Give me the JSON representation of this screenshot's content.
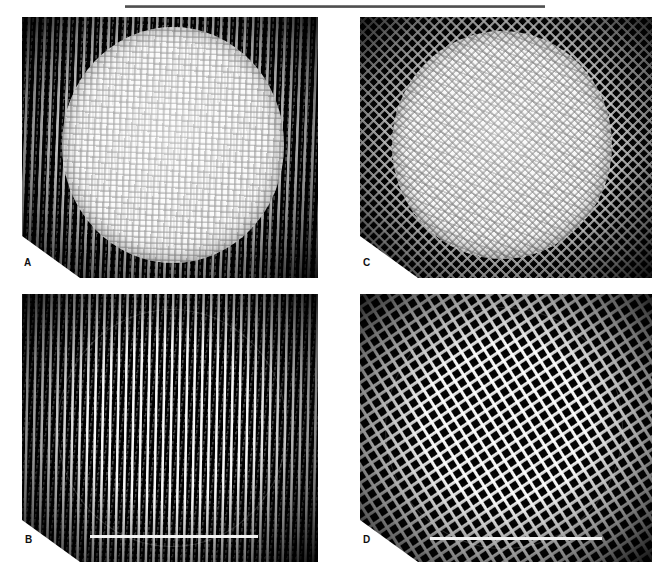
{
  "figure": {
    "kind": "four-panel-micrograph-figure",
    "separator": "horizontal-rule",
    "background_color": "#ffffff",
    "panel_background_color": "#050505",
    "specimen_highlight_color": "#f7f7f7",
    "notch_color": "#ffffff",
    "label_color": "#101010"
  },
  "panels": [
    {
      "id": "panel-a",
      "label": "A",
      "position": "top-left",
      "texture": "vertical-wale-knit",
      "disc": "bright-circular-specimen",
      "scalebar": false
    },
    {
      "id": "panel-c",
      "label": "C",
      "position": "top-right",
      "texture": "square-mesh",
      "disc": "bright-circular-specimen",
      "scalebar": false
    },
    {
      "id": "panel-b",
      "label": "B",
      "position": "bottom-left",
      "texture": "vertical-rib",
      "disc": "outlined-circular-specimen",
      "scalebar": true
    },
    {
      "id": "panel-d",
      "label": "D",
      "position": "bottom-right",
      "texture": "diagonal-mesh",
      "disc": "outlined-circular-specimen",
      "scalebar": true
    }
  ]
}
